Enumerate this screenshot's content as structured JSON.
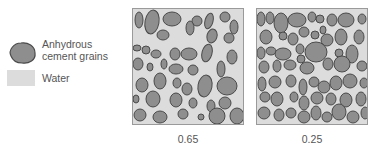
{
  "legend": {
    "grain_label_line1": "Anhydrous",
    "grain_label_line2": "cement grains",
    "water_label": "Water"
  },
  "panels": [
    {
      "caption": "0.65",
      "description": "water-cement ratio 0.65 — sparse grains"
    },
    {
      "caption": "0.25",
      "description": "water-cement ratio 0.25 — densely packed grains"
    }
  ],
  "colors": {
    "grain_fill": "#8e8e8e",
    "grain_stroke": "#4a4a4a",
    "water": "#dcdcdc",
    "border": "#9a9a9a"
  }
}
